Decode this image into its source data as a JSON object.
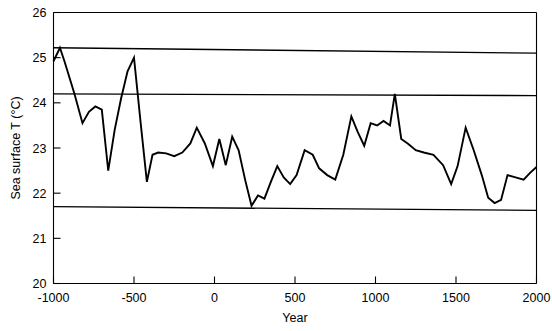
{
  "chart_data": {
    "type": "line",
    "title": "",
    "xlabel": "Year",
    "ylabel": "Sea surface T (°C)",
    "xlim": [
      -1000,
      2000
    ],
    "ylim": [
      20,
      26
    ],
    "grid": false,
    "legend": "none",
    "xticks": [
      -1000,
      -500,
      0,
      500,
      1000,
      1500,
      2000
    ],
    "xtick_labels": [
      "-1000",
      "-500",
      "0",
      "500",
      "1000",
      "1500",
      "2000"
    ],
    "yticks": [
      20,
      21,
      22,
      23,
      24,
      25,
      26
    ],
    "ytick_labels": [
      "20",
      "21",
      "22",
      "23",
      "24",
      "25",
      "26"
    ],
    "series": [
      {
        "name": "Sea surface temperature",
        "color": "#000000",
        "x": [
          -1000,
          -960,
          -930,
          -870,
          -820,
          -780,
          -740,
          -700,
          -660,
          -620,
          -580,
          -540,
          -500,
          -460,
          -420,
          -385,
          -350,
          -300,
          -250,
          -200,
          -150,
          -110,
          -60,
          -10,
          30,
          70,
          110,
          150,
          190,
          230,
          270,
          310,
          350,
          390,
          430,
          470,
          510,
          560,
          610,
          650,
          700,
          750,
          800,
          850,
          890,
          930,
          970,
          1010,
          1050,
          1090,
          1120,
          1160,
          1200,
          1250,
          1300,
          1360,
          1420,
          1470,
          1510,
          1560,
          1610,
          1660,
          1700,
          1740,
          1780,
          1820,
          1870,
          1920,
          1960,
          2000
        ],
        "y": [
          24.92,
          25.22,
          24.9,
          24.2,
          23.55,
          23.8,
          23.92,
          23.85,
          22.5,
          23.4,
          24.1,
          24.7,
          25.0,
          23.6,
          22.25,
          22.85,
          22.9,
          22.88,
          22.82,
          22.9,
          23.1,
          23.45,
          23.1,
          22.6,
          23.2,
          22.62,
          23.25,
          22.95,
          22.3,
          21.72,
          21.95,
          21.88,
          22.25,
          22.6,
          22.35,
          22.2,
          22.4,
          22.95,
          22.85,
          22.55,
          22.4,
          22.3,
          22.85,
          23.7,
          23.35,
          23.05,
          23.55,
          23.5,
          23.6,
          23.5,
          24.2,
          23.2,
          23.1,
          22.95,
          22.9,
          22.85,
          22.62,
          22.2,
          22.6,
          23.45,
          22.95,
          22.4,
          21.9,
          21.78,
          21.85,
          22.4,
          22.35,
          22.3,
          22.45,
          22.58
        ]
      }
    ],
    "reference_lines": [
      {
        "name": "upper-trend-line",
        "y_left": 25.22,
        "y_right": 25.1
      },
      {
        "name": "middle-trend-line",
        "y_left": 24.2,
        "y_right": 24.16
      },
      {
        "name": "lower-trend-line",
        "y_left": 21.7,
        "y_right": 21.62
      }
    ]
  }
}
